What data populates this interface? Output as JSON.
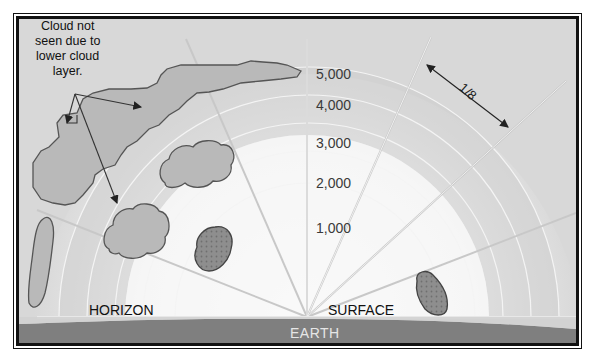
{
  "diagram": {
    "annotation": {
      "lines": [
        "Cloud not",
        "seen due to",
        "lower cloud",
        "layer."
      ]
    },
    "altitude_labels": [
      "5,000",
      "4,000",
      "3,000",
      "2,000",
      "1,000"
    ],
    "sector_label": "1/8",
    "ground_labels": {
      "horizon": "HORIZON",
      "surface": "SURFACE",
      "earth": "EARTH"
    },
    "colors": {
      "sky_outer": "#d6d6d6",
      "sky_band_high": "#c9c9c9",
      "sky_band_low": "#e2e2e2",
      "dome_inner": "#f2f2f2",
      "cloud_fill": "#b8b8b8",
      "cloud_low_fill": "#8c8c8c",
      "cloud_outline": "#555555",
      "ray": "#cfcfcf",
      "earth": "#7d7d7d",
      "frame": "#111111"
    }
  }
}
